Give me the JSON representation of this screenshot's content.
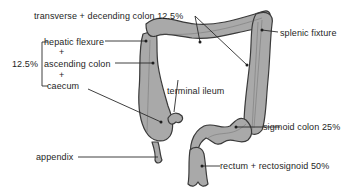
{
  "colors": {
    "colon_fill": "#a9a9a9",
    "colon_stroke": "#3a3a3a",
    "line": "#2a2a2a",
    "text": "#1e1e1e"
  },
  "labels": {
    "transverse_descending": "transverse + decending colon 12.5%",
    "hepatic_flexure": "hepatic flexure",
    "plus1": "+",
    "ascending_colon": "ascending colon",
    "plus2": "+",
    "caecum": "caecum",
    "group_percent": "12.5%",
    "terminal_ileum": "terminal ileum",
    "appendix": "appendix",
    "splenic_flexure": "splenic fixture",
    "sigmoid_colon": "sigmoid colon 25%",
    "rectum": "rectum + rectosignoid 50%"
  },
  "sites": [
    {
      "name": "hepatic flexure + ascending colon + caecum",
      "percent": 12.5
    },
    {
      "name": "transverse + decending colon",
      "percent": 12.5
    },
    {
      "name": "sigmoid colon",
      "percent": 25
    },
    {
      "name": "rectum + rectosignoid",
      "percent": 50
    }
  ]
}
